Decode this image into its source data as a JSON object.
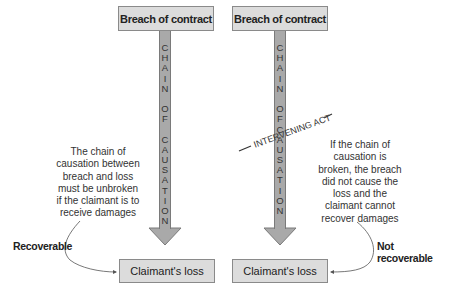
{
  "left_panel": {
    "top_box": "Breach of contract",
    "shaft_letters": [
      "C",
      "H",
      "A",
      "I",
      "N",
      "",
      "O",
      "F",
      "",
      "C",
      "A",
      "U",
      "S",
      "A",
      "T",
      "I",
      "O",
      "N"
    ],
    "note": [
      "The chain of",
      "causation between",
      "breach and loss",
      "must be unbroken",
      "if the claimant is to",
      "receive damages"
    ],
    "outcome_label": "Recoverable",
    "bottom_box": "Claimant's loss"
  },
  "right_panel": {
    "top_box": "Breach of contract",
    "shaft_letters": [
      "C",
      "H",
      "A",
      "I",
      "N",
      "",
      "O",
      "F",
      "C",
      "A",
      "U",
      "S",
      "A",
      "T",
      "I",
      "O",
      "N"
    ],
    "intervening_label": "INTERVENING ACT",
    "note": [
      "If the  chain of",
      "causation is",
      "broken, the breach",
      "did not cause the",
      "loss and the",
      "claimant cannot",
      "recover damages"
    ],
    "outcome_label": "Not recoverable",
    "bottom_box": "Claimant's loss"
  },
  "colors": {
    "box_fill": "#dcdcdc",
    "box_border": "#8a8a8a",
    "arrow_fill": "#a9a9a9",
    "arrow_border": "#7a7a7a"
  }
}
